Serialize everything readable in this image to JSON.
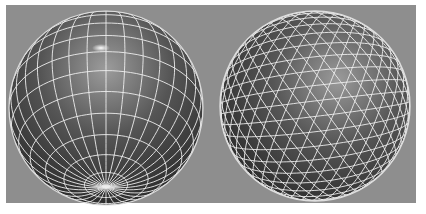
{
  "figure": {
    "background_color": "#8e8e8e",
    "frame_color": "#ffffff",
    "wire_color": "#f2f2f2",
    "sphere_dark": "#2e2e2e",
    "sphere_light": "#9a9a9a"
  },
  "spheres": [
    {
      "name": "uv-sphere",
      "type": "latitude-longitude",
      "cx": 106,
      "cy": 108,
      "r": 97,
      "pole_x": 101,
      "pole_y": 48,
      "latitude_rings": 14,
      "longitude_lines": 32
    },
    {
      "name": "geodesic-sphere",
      "type": "triangulated",
      "cx": 315,
      "cy": 106,
      "r": 95,
      "grid_spacing": 17
    }
  ]
}
